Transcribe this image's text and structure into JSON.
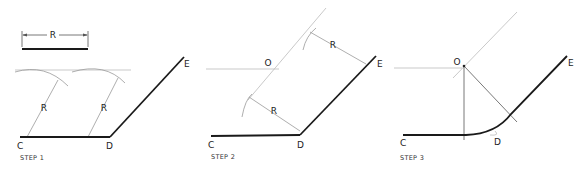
{
  "steps": [
    {
      "label": "STEP 1",
      "given_radius_label": "R",
      "radius_labels": [
        "R",
        "R"
      ],
      "points": {
        "C": "C",
        "D": "D",
        "E": "E"
      }
    },
    {
      "label": "STEP 2",
      "radius_labels": [
        "R",
        "R"
      ],
      "points": {
        "C": "C",
        "D": "D",
        "E": "E",
        "O": "O"
      }
    },
    {
      "label": "STEP 3",
      "points": {
        "C": "C",
        "D": "D",
        "E": "E",
        "O": "O"
      }
    }
  ]
}
